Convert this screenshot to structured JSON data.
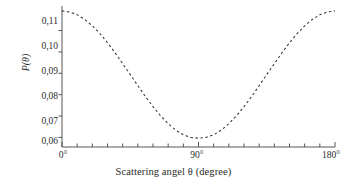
{
  "chart_data": {
    "type": "line",
    "title": "",
    "xlabel": "Scattering angel θ (degree)",
    "ylabel": "P(θ)",
    "xlim": [
      0,
      180
    ],
    "ylim": [
      0.0555,
      0.1215
    ],
    "grid": false,
    "legend": null,
    "linestyle": "dashed",
    "color": "#3a3a3a",
    "xticks": [
      0,
      90,
      180
    ],
    "xtick_labels": [
      "0°",
      "90°",
      "180°"
    ],
    "x_minor_tick_step": 10,
    "yticks": [
      0.06,
      0.07,
      0.08,
      0.09,
      0.1,
      0.11
    ],
    "ytick_labels": [
      "0,06",
      "0,07",
      "0,08",
      "0,09",
      "0,10",
      "0,11"
    ],
    "x": [
      0,
      5,
      10,
      15,
      20,
      25,
      30,
      35,
      40,
      45,
      50,
      55,
      60,
      65,
      70,
      75,
      80,
      85,
      90,
      95,
      100,
      105,
      110,
      115,
      120,
      125,
      130,
      135,
      140,
      145,
      150,
      155,
      160,
      165,
      170,
      175,
      180
    ],
    "values": [
      0.1192,
      0.1187,
      0.1174,
      0.1152,
      0.1122,
      0.1086,
      0.1043,
      0.0996,
      0.0945,
      0.0894,
      0.0842,
      0.0791,
      0.0744,
      0.0701,
      0.0664,
      0.0634,
      0.0612,
      0.06,
      0.0596,
      0.06,
      0.0612,
      0.0634,
      0.0664,
      0.0701,
      0.0744,
      0.0791,
      0.0842,
      0.0894,
      0.0945,
      0.0996,
      0.1043,
      0.1086,
      0.1122,
      0.1152,
      0.1174,
      0.1187,
      0.1192
    ],
    "annotations": []
  },
  "axes": {
    "spines": [
      "left",
      "bottom"
    ],
    "axis_color": "#555555"
  }
}
